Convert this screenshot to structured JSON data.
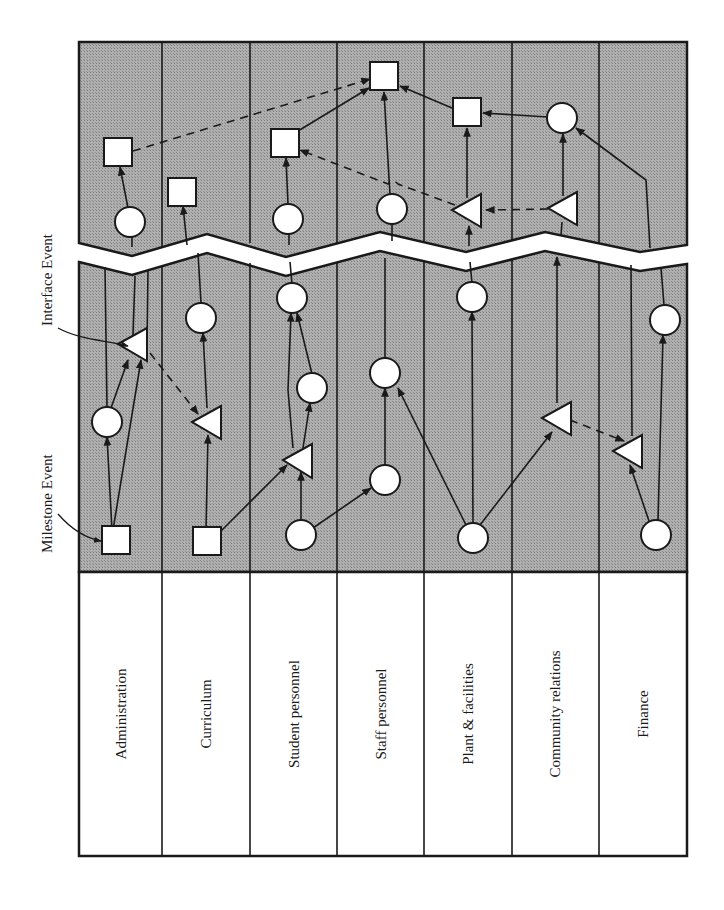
{
  "callouts": {
    "interface_event": "Interface Event",
    "milestone_event": "Milestone Event"
  },
  "lanes": [
    {
      "id": "administration",
      "label": "Administration"
    },
    {
      "id": "curriculum",
      "label": "Curriculum"
    },
    {
      "id": "student-personnel",
      "label": "Student personnel"
    },
    {
      "id": "staff-personnel",
      "label": "Staff personnel"
    },
    {
      "id": "plant-facilities",
      "label": "Plant & facilities"
    },
    {
      "id": "community-relations",
      "label": "Community relations"
    },
    {
      "id": "finance",
      "label": "Finance"
    }
  ],
  "legend": {
    "square": "milestone event",
    "triangle": "interface event",
    "circle": "activity event",
    "solid_arrow": "dependency",
    "dashed_arrow": "interface link"
  },
  "colors": {
    "shading": "#a8a8a8",
    "node_fill": "#ffffff",
    "stroke": "#1a1a1a",
    "label_panel": "#ffffff"
  }
}
